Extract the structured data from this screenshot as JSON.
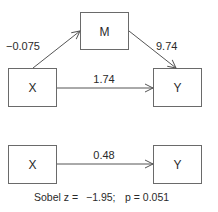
{
  "diagram": {
    "type": "mediation-model",
    "top_panel": {
      "nodes": [
        {
          "id": "X",
          "label": "X"
        },
        {
          "id": "M",
          "label": "M"
        },
        {
          "id": "Y",
          "label": "Y"
        }
      ],
      "edges": [
        {
          "from": "X",
          "to": "M",
          "label": "−0.075"
        },
        {
          "from": "M",
          "to": "Y",
          "label": "9.74"
        },
        {
          "from": "X",
          "to": "Y",
          "label": "1.74"
        }
      ]
    },
    "bottom_panel": {
      "nodes": [
        {
          "id": "X",
          "label": "X"
        },
        {
          "id": "Y",
          "label": "Y"
        }
      ],
      "edges": [
        {
          "from": "X",
          "to": "Y",
          "label": "0.48"
        }
      ]
    },
    "caption": {
      "sobel_label": "Sobel z =",
      "sobel_value": "−1.95;",
      "p_label": "p = 0.051"
    }
  }
}
